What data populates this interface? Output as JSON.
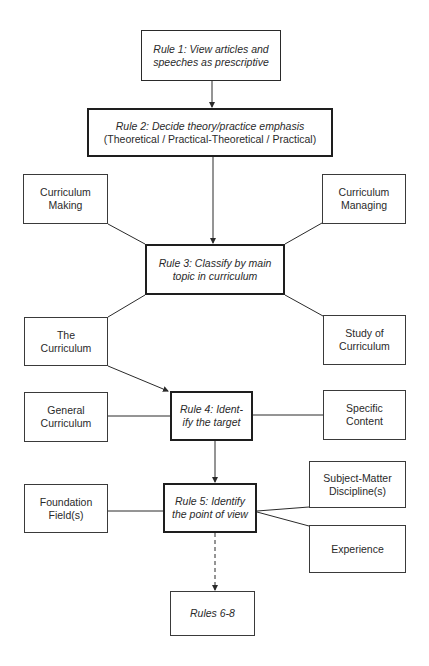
{
  "diagram": {
    "rule1": {
      "line1": "Rule 1: View articles and",
      "line2": "speeches as prescriptive"
    },
    "rule2": {
      "line1": "Rule 2: Decide theory/practice emphasis",
      "line2": "(Theoretical / Practical-Theoretical / Practical)"
    },
    "curriculum_making": {
      "line1": "Curriculum",
      "line2": "Making"
    },
    "curriculum_managing": {
      "line1": "Curriculum",
      "line2": "Managing"
    },
    "rule3": {
      "line1": "Rule 3: Classify by main",
      "line2": "topic in curriculum"
    },
    "the_curriculum": {
      "line1": "The",
      "line2": "Curriculum"
    },
    "study_of_curriculum": {
      "line1": "Study of",
      "line2": "Curriculum"
    },
    "general_curriculum": {
      "line1": "General",
      "line2": "Curriculum"
    },
    "rule4": {
      "line1": "Rule 4: Ident-",
      "line2": "ify the target"
    },
    "specific_content": {
      "line1": "Specific",
      "line2": "Content"
    },
    "foundation_fields": {
      "line1": "Foundation",
      "line2": "Field(s)"
    },
    "rule5": {
      "line1": "Rule 5: Identify",
      "line2": "the point of view"
    },
    "subject_matter": {
      "line1": "Subject-Matter",
      "line2": "Discipline(s)"
    },
    "experience": {
      "line1": "Experience"
    },
    "rules_6_8": {
      "line1": "Rules 6-8"
    }
  },
  "colors": {
    "line": "#2a2a2a",
    "background": "#ffffff"
  }
}
